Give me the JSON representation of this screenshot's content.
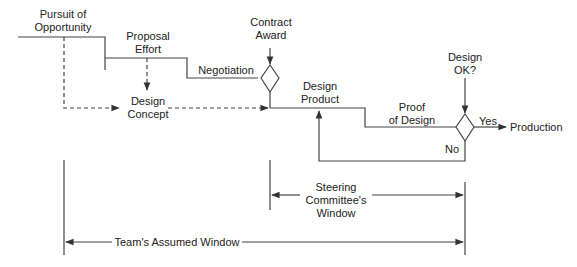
{
  "diagram": {
    "type": "process-flow",
    "nodes": {
      "pursuit": "Pursuit of\nOpportunity",
      "proposal": "Proposal\nEffort",
      "negotiation": "Negotiation",
      "contract_award": "Contract\nAward",
      "design_concept": "Design\nConcept",
      "design_product": "Design\nProduct",
      "proof_of_design": "Proof\nof Design",
      "design_ok": "Design\nOK?",
      "yes": "Yes",
      "no": "No",
      "production": "Production"
    },
    "labels": {
      "pursuit_1": "Pursuit of",
      "pursuit_2": "Opportunity",
      "proposal_1": "Proposal",
      "proposal_2": "Effort",
      "negotiation": "Negotiation",
      "contract_1": "Contract",
      "contract_2": "Award",
      "concept_1": "Design",
      "concept_2": "Concept",
      "product_1": "Design",
      "product_2": "Product",
      "proof_1": "Proof",
      "proof_2": "of Design",
      "ok_1": "Design",
      "ok_2": "OK?",
      "yes": "Yes",
      "no": "No",
      "production": "Production",
      "steering_1": "Steering",
      "steering_2": "Committee's",
      "steering_3": "Window",
      "team_window": "Team's Assumed Window"
    },
    "edges": [
      {
        "from": "Pursuit of Opportunity",
        "to": "Proposal Effort",
        "style": "solid"
      },
      {
        "from": "Proposal Effort",
        "to": "Negotiation",
        "style": "solid"
      },
      {
        "from": "Negotiation",
        "to": "Contract Award decision",
        "style": "solid"
      },
      {
        "from": "Pursuit of Opportunity",
        "to": "Design Concept",
        "style": "dashed"
      },
      {
        "from": "Proposal Effort",
        "to": "Design Concept",
        "style": "dashed"
      },
      {
        "from": "Design Concept",
        "to": "Design Product",
        "style": "dashed"
      },
      {
        "from": "Contract Award",
        "to": "Design Product",
        "style": "solid"
      },
      {
        "from": "Design Product",
        "to": "Proof of Design",
        "style": "solid"
      },
      {
        "from": "Proof of Design",
        "to": "Design OK? decision",
        "style": "solid"
      },
      {
        "from": "Design OK?",
        "to": "Production",
        "label": "Yes",
        "style": "solid"
      },
      {
        "from": "Design OK?",
        "to": "Design Product",
        "label": "No",
        "style": "solid"
      }
    ],
    "windows": [
      {
        "label": "Steering Committee's Window",
        "from_x": 270,
        "to_x": 465
      },
      {
        "label": "Team's Assumed Window",
        "from_x": 65,
        "to_x": 465
      }
    ],
    "colors": {
      "line": "#333333",
      "text": "#222222",
      "background": "#ffffff"
    }
  }
}
